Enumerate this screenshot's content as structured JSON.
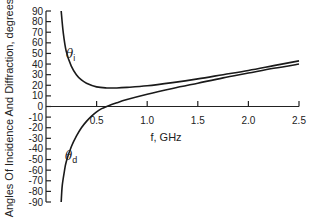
{
  "chart_data": {
    "type": "line",
    "title": "",
    "xlabel": "f, GHz",
    "ylabel": "Angles Of Incidence And Diffraction,  degrees",
    "xlim": [
      0,
      2.5
    ],
    "ylim": [
      -90,
      90
    ],
    "grid": false,
    "legend": "inline labels",
    "x_ticks": [
      0.5,
      1.0,
      1.5,
      2.0,
      2.5
    ],
    "x_tick_labels": [
      "0.5",
      "1.0",
      "1.5",
      "2.0",
      "2.5"
    ],
    "y_ticks": [
      90,
      80,
      70,
      60,
      50,
      40,
      30,
      20,
      10,
      0,
      -10,
      -20,
      -30,
      -40,
      -50,
      -60,
      -70,
      -80,
      -90
    ],
    "y_tick_labels": [
      "90",
      "80",
      "70",
      "60",
      "50",
      "40",
      "30",
      "20",
      "10",
      "0",
      "-10",
      "-20",
      "-30",
      "-40",
      "-50",
      "-60",
      "-70",
      "-80",
      "-90"
    ],
    "series": [
      {
        "name": "θi",
        "label_main": "θ",
        "label_sub": "i",
        "x": [
          0.15,
          0.17,
          0.2,
          0.25,
          0.3,
          0.35,
          0.4,
          0.5,
          0.6,
          0.7,
          0.8,
          1.0,
          1.25,
          1.5,
          1.75,
          2.0,
          2.25,
          2.5
        ],
        "values": [
          90,
          70,
          52,
          38,
          30,
          25,
          22,
          18.5,
          17.5,
          17.5,
          18,
          19.5,
          22.5,
          26,
          30,
          34,
          38.5,
          43
        ]
      },
      {
        "name": "θd",
        "label_main": "θ",
        "label_sub": "d",
        "x": [
          0.15,
          0.16,
          0.18,
          0.2,
          0.25,
          0.3,
          0.35,
          0.4,
          0.45,
          0.5,
          0.55,
          0.6,
          0.7,
          0.8,
          1.0,
          1.25,
          1.5,
          1.75,
          2.0,
          2.25,
          2.5
        ],
        "values": [
          -90,
          -75,
          -62,
          -52,
          -38,
          -28,
          -20,
          -14,
          -9,
          -5,
          -2,
          0,
          3.5,
          6.5,
          11.5,
          17,
          22,
          27,
          31.5,
          36,
          40
        ]
      }
    ]
  }
}
